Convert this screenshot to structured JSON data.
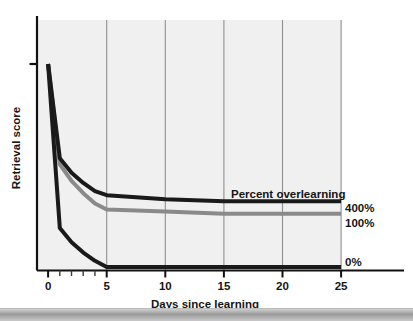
{
  "chart_data": {
    "type": "line",
    "title": "",
    "xlabel": "Days since learning",
    "ylabel": "Retrieval score",
    "xlim": [
      0,
      27.5
    ],
    "ylim": [
      0,
      100
    ],
    "grid": "vertical-only",
    "legend_position": "right-of-line-ends",
    "annotations": [
      {
        "text": "Percent overlearning",
        "x": 17.5,
        "y": 47
      }
    ],
    "xticks": [
      0,
      5,
      10,
      15,
      20,
      25
    ],
    "xtick_labels": [
      "0",
      "5",
      "10",
      "15",
      "20",
      "25"
    ],
    "xminor_ticks": [
      1,
      2,
      3,
      4
    ],
    "ytick_labels": [],
    "yticks_marked": [
      100
    ],
    "x": [
      0,
      1,
      2,
      3,
      4,
      5,
      10,
      15,
      20,
      25
    ],
    "series": [
      {
        "name": "400%",
        "label": "400%",
        "color": "#1a1a1a",
        "linewidth": 4,
        "values": [
          100,
          54,
          47,
          42,
          38,
          36,
          34,
          33,
          33,
          33
        ]
      },
      {
        "name": "100%",
        "label": "100%",
        "color": "#8a8a8a",
        "linewidth": 4,
        "values": [
          100,
          51,
          43,
          37,
          32,
          29,
          28,
          27,
          27,
          27
        ]
      },
      {
        "name": "0%",
        "label": "0%",
        "color": "#1a1a1a",
        "linewidth": 4,
        "values": [
          100,
          20,
          13,
          8,
          4,
          1,
          1,
          1,
          1,
          1
        ]
      }
    ],
    "colors": {
      "plot_background": "#f0f0f0",
      "gridline": "#909090",
      "axis": "#111111",
      "text": "#151515",
      "series_dark": "#1a1a1a",
      "series_gray": "#8a8a8a",
      "page_background": "#ffffff",
      "footer_band": "#a8a8a8"
    }
  },
  "figure": {
    "xaxis_title": "Days since learning",
    "yaxis_title": "Retrieval score",
    "annotation": "Percent overlearning",
    "xtick_labels": [
      "0",
      "5",
      "10",
      "15",
      "20",
      "25"
    ],
    "series_labels": [
      "400%",
      "100%",
      "0%"
    ]
  }
}
